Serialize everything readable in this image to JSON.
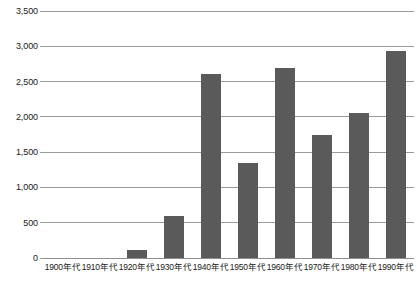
{
  "chart_data": {
    "type": "bar",
    "title": "",
    "subtitle": "",
    "xlabel": "",
    "ylabel": "",
    "categories": [
      "1900年代",
      "1910年代",
      "1920年代",
      "1930年代",
      "1940年代",
      "1950年代",
      "1960年代",
      "1970年代",
      "1980年代",
      "1990年代"
    ],
    "values": [
      0,
      0,
      110,
      600,
      2610,
      1350,
      2690,
      1740,
      2060,
      2930
    ],
    "series": [
      {
        "name": "",
        "values": [
          0,
          0,
          110,
          600,
          2610,
          1350,
          2690,
          1740,
          2060,
          2930
        ]
      }
    ],
    "ylim": [
      0,
      3500
    ],
    "y_ticks": [
      0,
      500,
      1000,
      1500,
      2000,
      2500,
      3000,
      3500
    ],
    "y_tick_labels": [
      "0",
      "500",
      "1,000",
      "1,500",
      "2,000",
      "2,500",
      "3,000",
      "3,500"
    ],
    "grid": true,
    "legend": false,
    "legend_position": "none",
    "bar_color": "#5a5a5a",
    "gridline_color": "#9b9b9b",
    "background_color": "#ffffff",
    "text_color": "#1a1a1a"
  }
}
